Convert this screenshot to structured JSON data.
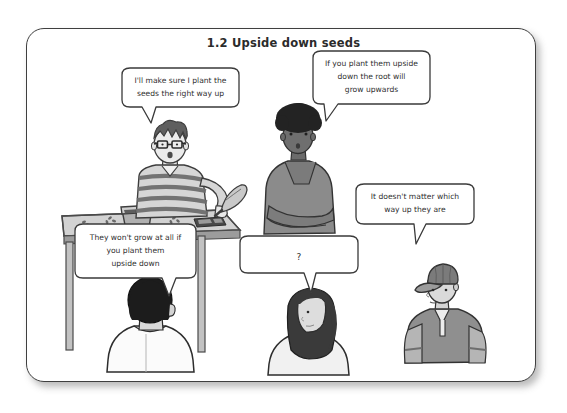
{
  "page": {
    "title": "1.2 Upside down seeds",
    "background_color": "#ffffff",
    "frame_border_color": "#3f3f3f"
  },
  "speech_bubbles": [
    {
      "id": "bubble-teacher",
      "speaker": "teacher-with-glasses",
      "lines": [
        "I'll make sure I plant the",
        "seeds the right way up"
      ],
      "tail_direction": "down-left"
    },
    {
      "id": "bubble-afro-student",
      "speaker": "student-afro-hair",
      "lines": [
        "If you plant them upside",
        "down the root will",
        "grow upwards"
      ],
      "tail_direction": "down-left"
    },
    {
      "id": "bubble-cap-student",
      "speaker": "student-baseball-cap",
      "lines": [
        "It doesn't matter which",
        "way up they are"
      ],
      "tail_direction": "down"
    },
    {
      "id": "bubble-short-hair-student",
      "speaker": "student-short-hair-back",
      "lines": [
        "They won't grow at all if",
        "you plant them",
        "upside down"
      ],
      "tail_direction": "down-right"
    },
    {
      "id": "bubble-long-hair-student",
      "speaker": "student-long-hair-back",
      "lines": [
        "?"
      ],
      "tail_direction": "down-right"
    }
  ],
  "characters": [
    {
      "id": "teacher-with-glasses",
      "description": "teacher with spiky hair, glasses, striped shirt, holding a trowel",
      "skin_color": "#e8e8e8",
      "shirt_color": "#bfbfbf",
      "hair_color": "#555555"
    },
    {
      "id": "student-afro-hair",
      "description": "student with afro hair, dark skin, grey top, arms crossed",
      "skin_color": "#6f6f6f",
      "shirt_color": "#8a8a8a",
      "hair_color": "#2a2a2a"
    },
    {
      "id": "student-baseball-cap",
      "description": "student wearing a baseball cap and hooded jacket",
      "skin_color": "#d8d8d8",
      "shirt_color": "#9a9a9a",
      "hair_color": "#6d6d6d"
    },
    {
      "id": "student-short-hair-back",
      "description": "student seen from behind with short dark hair and white shirt",
      "skin_color": "#dcdcdc",
      "shirt_color": "#fbfbfb",
      "hair_color": "#1f1f1f"
    },
    {
      "id": "student-long-hair-back",
      "description": "student seen from behind with long dark hair and light top",
      "skin_color": "#dddddd",
      "shirt_color": "#f2f2f2",
      "hair_color": "#3a3a3a"
    }
  ],
  "props": [
    {
      "id": "table",
      "description": "grey classroom table"
    },
    {
      "id": "plant-pot",
      "description": "plant pot filled with soil"
    },
    {
      "id": "trowel",
      "description": "garden trowel held by teacher"
    },
    {
      "id": "seed-tray",
      "description": "dark seed tray on table"
    },
    {
      "id": "scattered-seeds",
      "description": "scattered seeds on table"
    }
  ]
}
